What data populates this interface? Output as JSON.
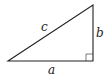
{
  "diagram": {
    "type": "right-triangle",
    "labels": {
      "hypotenuse": "c",
      "vertical_leg": "b",
      "horizontal_leg": "a"
    },
    "right_angle_marker": true,
    "stroke_color": "#222222",
    "background": "#ffffff"
  }
}
